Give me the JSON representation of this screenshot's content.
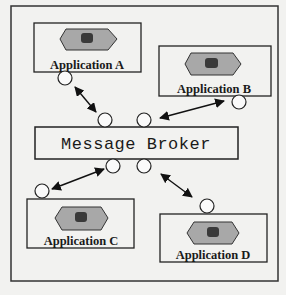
{
  "diagram": {
    "type": "message-broker-architecture",
    "broker": {
      "label": "Message Broker"
    },
    "applications": [
      {
        "id": "A",
        "label": "Application A"
      },
      {
        "id": "B",
        "label": "Application B"
      },
      {
        "id": "C",
        "label": "Application C"
      },
      {
        "id": "D",
        "label": "Application D"
      }
    ],
    "connections": [
      {
        "from": "Application A",
        "to": "Message Broker",
        "direction": "bidirectional"
      },
      {
        "from": "Application B",
        "to": "Message Broker",
        "direction": "bidirectional"
      },
      {
        "from": "Application C",
        "to": "Message Broker",
        "direction": "bidirectional"
      },
      {
        "from": "Application D",
        "to": "Message Broker",
        "direction": "bidirectional"
      }
    ],
    "colors": {
      "background": "#f2f2f0",
      "stroke": "#222222",
      "app_icon_fill": "#a8a8a8",
      "app_icon_core": "#3a3a3a"
    }
  }
}
